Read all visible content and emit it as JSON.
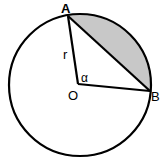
{
  "diagram": {
    "colors": {
      "stroke": "#000000",
      "segment_fill": "#c8c8c8",
      "background": "#ffffff"
    },
    "circle": {
      "cx": 80,
      "cy": 85,
      "r": 72
    },
    "points": {
      "A": {
        "label": "A",
        "x": 68,
        "y": 14
      },
      "O": {
        "label": "O",
        "x": 78,
        "y": 84
      },
      "B": {
        "label": "B",
        "x": 151,
        "y": 91
      }
    },
    "labels": {
      "A": "A",
      "O": "O",
      "B": "B",
      "radius": "r",
      "angle": "α"
    },
    "shaded_region": "segment between chord AB and arc AB"
  }
}
